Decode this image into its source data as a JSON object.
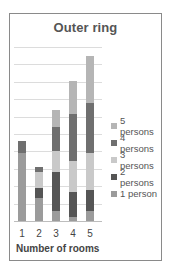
{
  "chart_data": {
    "type": "bar",
    "stacked": true,
    "title": "Outer ring",
    "xlabel": "Number of rooms",
    "ylabel": "",
    "categories": [
      "1",
      "2",
      "3",
      "4",
      "5"
    ],
    "series": [
      {
        "name": "1 person",
        "color": "#9b9b9b",
        "values": [
          3.9,
          1.3,
          0.6,
          0.25,
          0.6
        ]
      },
      {
        "name": "2 persons",
        "color": "#555555",
        "values": [
          0,
          0.6,
          2.2,
          1.4,
          1.2
        ]
      },
      {
        "name": "3 persons",
        "color": "#c9c9c9",
        "values": [
          0,
          0.9,
          1.2,
          1.8,
          2.1
        ]
      },
      {
        "name": "4 persons",
        "color": "#6f6f6f",
        "values": [
          0.7,
          0.3,
          1.4,
          2.7,
          2.9
        ]
      },
      {
        "name": "5 persons",
        "color": "#b5b5b5",
        "values": [
          0,
          0,
          1.0,
          1.9,
          2.7
        ]
      }
    ],
    "ylim": [
      0,
      10
    ],
    "y_gridlines": 10,
    "grid": true,
    "y_axis_labels_visible": false,
    "legend_position": "right",
    "legend_order": [
      "5 persons",
      "4 persons",
      "3 persons",
      "2 persons",
      "1 person"
    ]
  }
}
